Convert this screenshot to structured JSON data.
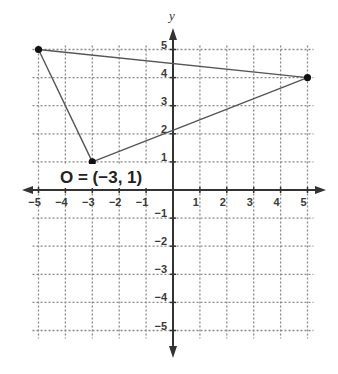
{
  "chart_data": {
    "type": "scatter",
    "title": "",
    "xlabel": "",
    "ylabel": "y",
    "xlim": [
      -5,
      5
    ],
    "ylim": [
      -5,
      5
    ],
    "grid": true,
    "grid_style": "dotted",
    "x_ticks": [
      -5,
      -4,
      -3,
      -2,
      -1,
      1,
      2,
      3,
      4,
      5
    ],
    "y_ticks": [
      -5,
      -4,
      -3,
      -2,
      -1,
      1,
      2,
      3,
      4,
      5
    ],
    "x_tick_labels": [
      "−5",
      "−4",
      "−3",
      "−2",
      "−1",
      "1",
      "2",
      "3",
      "4",
      "5"
    ],
    "y_tick_labels": [
      "−5",
      "−4",
      "−3",
      "−2",
      "−1",
      "1",
      "2",
      "3",
      "4",
      "5"
    ],
    "shape": "triangle",
    "points": [
      {
        "x": -5,
        "y": 5
      },
      {
        "x": 5,
        "y": 4
      },
      {
        "x": -3,
        "y": 1
      }
    ],
    "segments": [
      {
        "from": [
          -5,
          5
        ],
        "to": [
          5,
          4
        ]
      },
      {
        "from": [
          5,
          4
        ],
        "to": [
          -3,
          1
        ]
      },
      {
        "from": [
          -3,
          1
        ],
        "to": [
          -5,
          5
        ]
      }
    ],
    "annotations": [
      {
        "text": "O = (−3, 1)",
        "x": -3,
        "y": 1
      }
    ]
  },
  "labels": {
    "y_axis": "y",
    "point_label": "O = (−3, 1)"
  },
  "colors": {
    "axis": "#333333",
    "grid": "#8a8a8a",
    "segment": "#555555",
    "point": "#111111"
  }
}
